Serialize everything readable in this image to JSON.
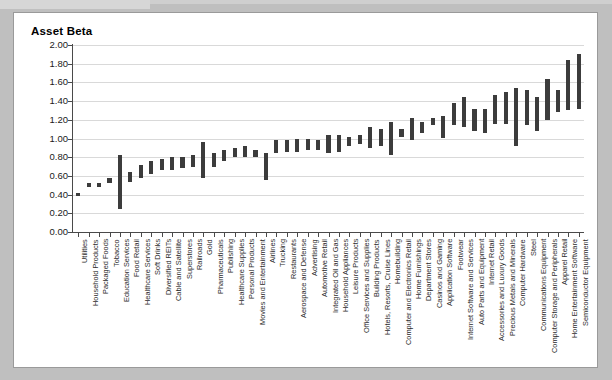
{
  "chart_card": {
    "title": "Asset Beta"
  },
  "chart_data": {
    "type": "bar",
    "subtype": "floating-high-low-range-bar",
    "title": "Asset Beta",
    "xlabel": "",
    "ylabel": "Asset Beta",
    "ylim": [
      0.0,
      2.0
    ],
    "ytick_labels": [
      "2.00",
      "1.80",
      "1.60",
      "1.40",
      "1.20",
      "1.00",
      "0.80",
      "0.60",
      "0.40",
      "0.20",
      "0.00"
    ],
    "ytick_values": [
      2.0,
      1.8,
      1.6,
      1.4,
      1.2,
      1.0,
      0.8,
      0.6,
      0.4,
      0.2,
      0.0
    ],
    "grid": true,
    "legend": "none",
    "bar_color": "#3c3c3c",
    "categories": [
      "Utilities",
      "Household Products",
      "Packaged Foods",
      "Tobacco",
      "Education Services",
      "Food Retail",
      "Healthcare Services",
      "Soft Drinks",
      "Diversified REITs",
      "Cable and Satellite",
      "Superstores",
      "Railroads",
      "Gold",
      "Pharmaceuticals",
      "Publishing",
      "Healthcare Supplies",
      "Personal Products",
      "Movies and Entertainment",
      "Airlines",
      "Trucking",
      "Restaurants",
      "Aerospace and Defense",
      "Advertising",
      "Automotive Retail",
      "Integrated Oil and Gas",
      "Household Appliances",
      "Leisure Products",
      "Office Services and Supplies",
      "Building Products",
      "Hotels, Resorts, Cruise Lines",
      "Homebuilding",
      "Computer and Electronics Retail",
      "Home Furnishings",
      "Department Stores",
      "Casinos and Gaming",
      "Application Software",
      "Footwear",
      "Internet Software and Services",
      "Auto Parts and Equipment",
      "Internet Retail",
      "Accessories and Luxury Goods",
      "Precious Metals and Minerals",
      "Computer Hardware",
      "Steel",
      "Communications Equipment",
      "Computer Storage and Peripherals",
      "Apparel Retail",
      "Home Entertainment Software",
      "Semiconductor Equipment"
    ],
    "series": [
      {
        "name": "Asset Beta Range",
        "low": [
          0.38,
          0.48,
          0.48,
          0.52,
          0.25,
          0.54,
          0.58,
          0.62,
          0.66,
          0.66,
          0.68,
          0.7,
          0.58,
          0.7,
          0.76,
          0.8,
          0.8,
          0.8,
          0.56,
          0.84,
          0.86,
          0.86,
          0.88,
          0.88,
          0.84,
          0.86,
          0.92,
          0.94,
          0.9,
          0.92,
          0.82,
          1.02,
          0.98,
          1.06,
          1.14,
          1.0,
          1.14,
          1.12,
          1.08,
          1.06,
          1.16,
          1.16,
          0.92,
          1.14,
          1.08,
          1.2,
          1.28,
          1.3,
          1.32
        ],
        "high": [
          0.42,
          0.52,
          0.52,
          0.58,
          0.82,
          0.64,
          0.72,
          0.76,
          0.78,
          0.8,
          0.8,
          0.82,
          0.96,
          0.84,
          0.88,
          0.9,
          0.92,
          0.88,
          0.84,
          0.98,
          0.98,
          1.0,
          1.0,
          0.98,
          1.04,
          1.04,
          1.02,
          1.04,
          1.12,
          1.1,
          1.18,
          1.1,
          1.22,
          1.18,
          1.22,
          1.24,
          1.38,
          1.44,
          1.32,
          1.32,
          1.46,
          1.5,
          1.54,
          1.52,
          1.44,
          1.64,
          1.52,
          1.84,
          1.9
        ]
      }
    ]
  }
}
